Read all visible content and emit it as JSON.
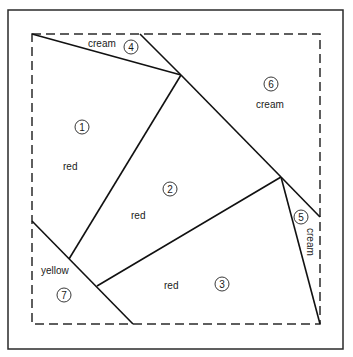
{
  "diagram": {
    "frame": {
      "x": 8,
      "y": 10,
      "width": 335,
      "height": 339
    },
    "seam_line": {
      "x": 32,
      "y": 34,
      "width": 288,
      "height": 290,
      "style": "dashed"
    },
    "pieces": [
      {
        "id": 1,
        "number": "1",
        "color": "red",
        "label_pos": [
          63,
          167
        ],
        "num_pos": [
          82,
          127
        ]
      },
      {
        "id": 2,
        "number": "2",
        "color": "red",
        "label_pos": [
          138,
          218
        ],
        "num_pos": [
          170,
          189
        ]
      },
      {
        "id": 3,
        "number": "3",
        "color": "red",
        "label_pos": [
          173,
          292
        ],
        "num_pos": [
          222,
          284
        ]
      },
      {
        "id": 4,
        "number": "4",
        "color": "cream",
        "label_pos": [
          89,
          47
        ],
        "num_pos": [
          130,
          47
        ]
      },
      {
        "id": 5,
        "number": "5",
        "color": "cream",
        "label_pos": [
          311,
          228
        ],
        "num_pos": [
          301,
          217
        ],
        "rotated": true
      },
      {
        "id": 6,
        "number": "6",
        "color": "cream",
        "label_pos": [
          256,
          108
        ],
        "num_pos": [
          271,
          84
        ]
      },
      {
        "id": 7,
        "number": "7",
        "color": "yellow",
        "label_pos": [
          42,
          275
        ],
        "num_pos": [
          64,
          295
        ]
      }
    ],
    "lines": [
      [
        32,
        34,
        181,
        75
      ],
      [
        140,
        34,
        181,
        75
      ],
      [
        181,
        75,
        69,
        259
      ],
      [
        181,
        75,
        281,
        177
      ],
      [
        281,
        177,
        320,
        217
      ],
      [
        281,
        177,
        320,
        324
      ],
      [
        281,
        177,
        97,
        286
      ],
      [
        32,
        221,
        133,
        324
      ]
    ]
  },
  "labels": {
    "p1_color": "red",
    "p1_num": "1",
    "p2_color": "red",
    "p2_num": "2",
    "p3_color": "red",
    "p3_num": "3",
    "p4_color": "cream",
    "p4_num": "4",
    "p5_color": "cream",
    "p5_num": "5",
    "p6_color": "cream",
    "p6_num": "6",
    "p7_color": "yellow",
    "p7_num": "7"
  }
}
